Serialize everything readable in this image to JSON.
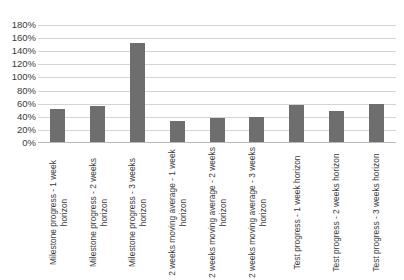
{
  "chart_data": {
    "type": "bar",
    "title": "",
    "subtitle": "",
    "xlabel": "",
    "ylabel": "",
    "ylim": [
      0,
      180
    ],
    "ytick_step": 20,
    "grid": true,
    "legend": false,
    "legend_position": "none",
    "bar_color": "#6e6e6e",
    "gridline_color": "#d4d4d4",
    "axis_text_color": "#3a3a3a",
    "background_color": "#ffffff",
    "value_unit": "%",
    "ytick_labels": [
      "180%",
      "160%",
      "140%",
      "120%",
      "100%",
      "80%",
      "60%",
      "40%",
      "20%",
      "0%"
    ],
    "ytick_values": [
      180,
      160,
      140,
      120,
      100,
      80,
      60,
      40,
      20,
      0
    ],
    "categories": [
      "Milestone progress - 1 week horizon",
      "Milestone progress - 2 weeks horizon",
      "Milestone progress - 3 weeks horizon",
      "2 weeks moving average - 1 week horizon",
      "2 weeks moving average - 2 weeks horizon",
      "2 weeks moving average - 3 weeks horizon",
      "Test progress - 1 week horizon",
      "Test progress - 2 weeks horizon",
      "Test progress - 3 weeks horizon"
    ],
    "values": [
      52,
      57,
      153,
      34,
      38,
      40,
      58,
      49,
      60
    ]
  }
}
